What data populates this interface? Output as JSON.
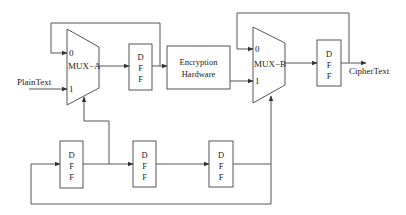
{
  "diagram": {
    "type": "block-diagram",
    "labels": {
      "mux_a": "MUX−A",
      "mux_b": "MUX−B",
      "mux_a_in0": "0",
      "mux_a_in1": "1",
      "mux_b_in0": "0",
      "mux_b_in1": "1",
      "input": "PlainText",
      "output": "CipherText",
      "enc_line1": "Encryption",
      "enc_line2": "Hardware",
      "dff_d": "D",
      "dff_f1": "F",
      "dff_f2": "F"
    },
    "nodes": [
      {
        "id": "mux-a",
        "label": "MUX-A"
      },
      {
        "id": "dff-a",
        "label": "DFF"
      },
      {
        "id": "encryption-hardware",
        "label": "Encryption Hardware"
      },
      {
        "id": "mux-b",
        "label": "MUX-B"
      },
      {
        "id": "dff-b",
        "label": "DFF"
      },
      {
        "id": "dff-ctrl-1",
        "label": "DFF"
      },
      {
        "id": "dff-ctrl-2",
        "label": "DFF"
      },
      {
        "id": "dff-ctrl-3",
        "label": "DFF"
      }
    ],
    "edges": [
      {
        "from": "PlainText",
        "to": "mux-a",
        "port": "1"
      },
      {
        "from": "mux-a",
        "to": "dff-a"
      },
      {
        "from": "dff-a",
        "to": "encryption-hardware"
      },
      {
        "from": "dff-a",
        "to": "mux-a",
        "port": "0"
      },
      {
        "from": "encryption-hardware",
        "to": "mux-b",
        "port": "1"
      },
      {
        "from": "mux-b",
        "to": "dff-b"
      },
      {
        "from": "dff-b",
        "to": "CipherText"
      },
      {
        "from": "dff-b",
        "to": "mux-b",
        "port": "0"
      },
      {
        "from": "dff-ctrl-1",
        "to": "dff-ctrl-2"
      },
      {
        "from": "dff-ctrl-1",
        "to": "mux-a",
        "port": "select"
      },
      {
        "from": "dff-ctrl-2",
        "to": "dff-ctrl-3"
      },
      {
        "from": "dff-ctrl-3",
        "to": "mux-b",
        "port": "select"
      },
      {
        "from": "dff-ctrl-3",
        "to": "dff-ctrl-1"
      }
    ]
  }
}
